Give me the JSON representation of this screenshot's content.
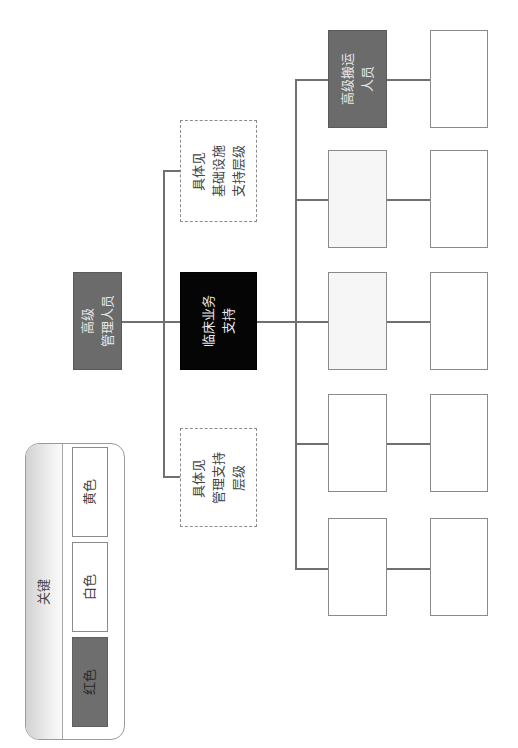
{
  "legend": {
    "title": "关键",
    "items": [
      {
        "label": "黄色",
        "color": "#ffffff"
      },
      {
        "label": "白色",
        "color": "#ffffff"
      },
      {
        "label": "红色",
        "color": "#6e6e6e"
      }
    ]
  },
  "chart": {
    "root": {
      "lines": [
        "高级",
        "管理人员"
      ],
      "color": "#6b6b6b"
    },
    "level2": [
      {
        "lines": [
          "具体见",
          "基础设施",
          "支持层级"
        ],
        "style": "dashed"
      },
      {
        "lines": [
          "临床业务",
          "支持"
        ],
        "color": "#050505"
      },
      {
        "lines": [
          "具体见",
          "管理支持",
          "层级"
        ],
        "style": "dashed"
      }
    ],
    "level3": [
      {
        "lines": [
          "高级搬运",
          "人员"
        ],
        "color": "#6b6b6b"
      },
      {
        "lines": [],
        "color": "#f6f6f6"
      },
      {
        "lines": [],
        "color": "#f6f6f6"
      },
      {
        "lines": [],
        "color": "#ffffff"
      },
      {
        "lines": [],
        "color": "#ffffff"
      }
    ],
    "level4": [
      {
        "lines": []
      },
      {
        "lines": []
      },
      {
        "lines": []
      },
      {
        "lines": []
      },
      {
        "lines": []
      }
    ]
  }
}
